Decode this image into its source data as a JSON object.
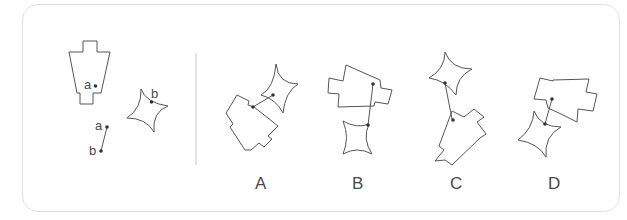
{
  "question": {
    "point_a_label": "a",
    "point_b_label": "b",
    "segment_labels": {
      "a": "a",
      "b": "b"
    }
  },
  "options": [
    {
      "label": "A"
    },
    {
      "label": "B"
    },
    {
      "label": "C"
    },
    {
      "label": "D"
    }
  ],
  "colors": {
    "stroke": "#555555",
    "text": "#4a4a4a",
    "divider": "#cccccc",
    "border": "#e2e2e2"
  }
}
